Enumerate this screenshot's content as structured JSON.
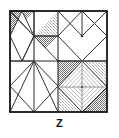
{
  "figure": {
    "label": "Z",
    "type": "geometric-tiling-diagram",
    "colors": {
      "outline": "#1a1a1a",
      "grid_line": "#2b2b2b",
      "thin_line": "#555555",
      "light_line": "#9a9a9a",
      "shade_dark": "#8d8d8d",
      "shade_light": "#c9c9c9",
      "background": "#ffffff"
    },
    "geometry": {
      "frame": {
        "x": 10,
        "y": 11,
        "width": 97,
        "height": 101
      },
      "grid_columns": 4,
      "grid_rows": 4,
      "concentric_diamond_count": 5
    }
  }
}
